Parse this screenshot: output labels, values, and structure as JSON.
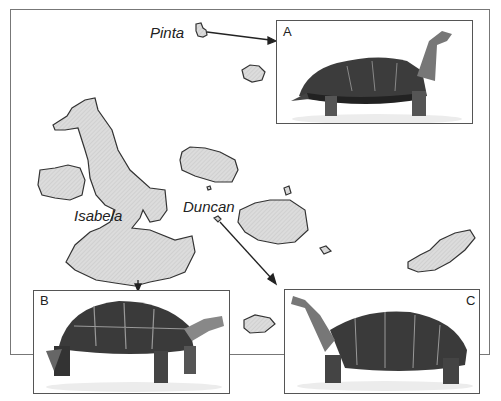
{
  "islands": {
    "pinta": "Pinta",
    "isabela": "Isabela",
    "duncan": "Duncan"
  },
  "panels": {
    "a": {
      "letter": "A",
      "subject": "saddleback tortoise, long neck, raised shell"
    },
    "b": {
      "letter": "B",
      "subject": "domed tortoise"
    },
    "c": {
      "letter": "C",
      "subject": "intermediate tortoise, long neck"
    }
  },
  "colors": {
    "island_fill": "#d8d8d8",
    "island_stroke": "#333333",
    "frame": "#777777"
  }
}
